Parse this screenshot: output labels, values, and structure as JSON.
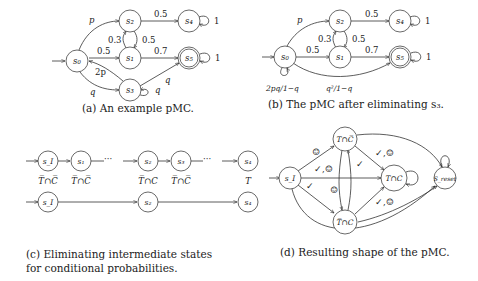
{
  "panels": {
    "a": {
      "caption": "(a) An example pMC.",
      "states": {
        "s0": "s₀",
        "s1": "s₁",
        "s2": "s₂",
        "s3": "s₃",
        "s4": "s₄",
        "s5": "s₅"
      },
      "edges": {
        "s0_s2": "p",
        "s0_s1": "0.5",
        "s0_s3": "q",
        "s3_s0": "2p",
        "s1_s2": "0.3",
        "s2_s1": "0.5",
        "s2_s4": "0.5",
        "s1_s5": "0.7",
        "s3_s5": "q",
        "s3_self": "q",
        "s4_self": "1",
        "s5_self": "1"
      }
    },
    "b": {
      "caption": "(b) The pMC after eliminating s₃.",
      "states": {
        "s0": "s₀",
        "s1": "s₁",
        "s2": "s₂",
        "s4": "s₄",
        "s5": "s₅"
      },
      "edges": {
        "s0_s2": "p",
        "s0_s1": "0.5",
        "s1_s2": "0.3",
        "s2_s1": "0.5",
        "s2_s4": "0.5",
        "s1_s5": "0.7",
        "s4_self": "1",
        "s5_self": "1",
        "s0_self": "2pq/1−q",
        "s0_s5": "q²/1−q"
      }
    },
    "c": {
      "caption_line1": "(c) Eliminating intermediate states",
      "caption_line2": "for conditional probabilities.",
      "row1_states": [
        "s_I",
        "s₁",
        "s₂",
        "s₃",
        "s₄"
      ],
      "row1_labels": [
        "T̅∩C̅",
        "T̅∩C̅",
        "T̅∩C",
        "T̅∩C̅",
        "T"
      ],
      "row2_states": [
        "s_I",
        "s₂",
        "s₄"
      ],
      "ellipsis": "···"
    },
    "d": {
      "caption": "(d) Resulting shape of the pMC.",
      "states": {
        "sI": "s_I",
        "tnc_bar": "T∩C̅",
        "tbar_c": "T̅∩C",
        "t_c": "T∩C",
        "reset": "S_reset"
      },
      "edge_labels": {
        "sI_tncbar": "☺",
        "sI_tc": "✓,☺",
        "sI_tbarc": "✓",
        "tncbar_tc": "✓,☺",
        "tncbar_tbarc": "✓",
        "tbarc_tncbar": "☺",
        "tbarc_tc": "✓,☺"
      }
    }
  }
}
